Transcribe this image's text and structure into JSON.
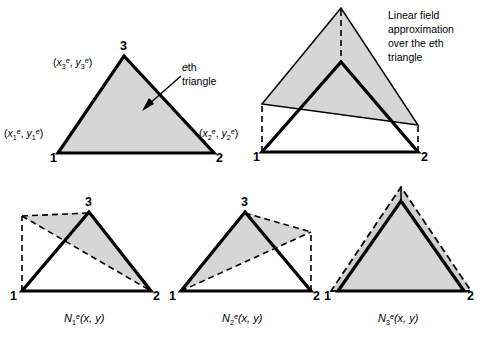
{
  "figure": {
    "background_color": "#ffffff",
    "fill_color": "#d6d6d6",
    "line_color": "#000000",
    "panels": {
      "top_left": {
        "name": "eth-triangle-panel",
        "vertex_labels": [
          "1",
          "2",
          "3"
        ],
        "coord_label_1": {
          "open": "(",
          "x_sym": "x",
          "x_sub": "1",
          "x_sup": "e",
          "comma": ", ",
          "y_sym": "y",
          "y_sub": "1",
          "y_sup": "e",
          "close": ")"
        },
        "coord_label_2": {
          "open": "(",
          "x_sym": "x",
          "x_sub": "2",
          "x_sup": "e",
          "comma": ", ",
          "y_sym": "y",
          "y_sub": "2",
          "y_sup": "e",
          "close": ")"
        },
        "coord_label_3": {
          "open": "(",
          "x_sym": "x",
          "x_sub": "3",
          "x_sup": "e",
          "comma": ", ",
          "y_sym": "y",
          "y_sub": "3",
          "y_sup": "e",
          "close": ")"
        },
        "annotation": {
          "italic_part": "e",
          "rest_line1": "th",
          "line2": "triangle"
        }
      },
      "top_right": {
        "name": "linear-field-approximation-panel",
        "vertex_labels": [
          "1",
          "2"
        ],
        "annotation_lines": [
          "Linear field",
          "approximation",
          "over the",
          "triangle"
        ],
        "annotation_italic": "e",
        "annotation_italic_suffix": "th"
      },
      "bottom_left": {
        "name": "shape-function-n1-panel",
        "vertex_labels": [
          "1",
          "2",
          "3"
        ],
        "caption": {
          "sym": "N",
          "sub": "1",
          "sup": "e",
          "args": "(x, y)"
        }
      },
      "bottom_middle": {
        "name": "shape-function-n2-panel",
        "vertex_labels": [
          "1",
          "2",
          "3"
        ],
        "caption": {
          "sym": "N",
          "sub": "2",
          "sup": "e",
          "args": "(x, y)"
        }
      },
      "bottom_right": {
        "name": "shape-function-n3-panel",
        "vertex_labels": [
          "1",
          "2"
        ],
        "caption": {
          "sym": "N",
          "sub": "3",
          "sup": "e",
          "args": "(x, y)"
        }
      }
    }
  }
}
